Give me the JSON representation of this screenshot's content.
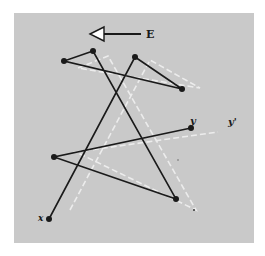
{
  "figure": {
    "background_color": "#c9c9c9",
    "line_color": "#1a1a1a",
    "ghost_color": "#f2f2f2",
    "direction_arrow": {
      "label": "E",
      "points": "left"
    },
    "labels": {
      "start": "x",
      "end": "y",
      "end_prime": "y'"
    },
    "points": [
      {
        "id": "x",
        "cx": 49,
        "cy": 219
      },
      {
        "id": "p1",
        "cx": 135,
        "cy": 57
      },
      {
        "id": "p2",
        "cx": 182,
        "cy": 89
      },
      {
        "id": "p3",
        "cx": 64,
        "cy": 61
      },
      {
        "id": "p4",
        "cx": 93,
        "cy": 51
      },
      {
        "id": "p5",
        "cx": 176,
        "cy": 199
      },
      {
        "id": "p6",
        "cx": 54,
        "cy": 157
      },
      {
        "id": "y",
        "cx": 191,
        "cy": 128
      }
    ],
    "path": "x → p1 → p2 → p3 → p4 → p5 → p6 → y"
  }
}
